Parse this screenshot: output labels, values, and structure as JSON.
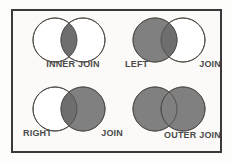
{
  "diagram": {
    "frame_color": "#3a3a3a",
    "background_color": "#fbfaf8",
    "fill_color": "#808080",
    "overlap_color": "#6e6e6e",
    "outline_color": "#55504c",
    "empty_color": "#ffffff",
    "label_color": "#4a4a4a",
    "panels": [
      {
        "id": "inner-join",
        "name": "INNER JOIN",
        "labels": [
          "INNER JOIN"
        ],
        "label_layout": "center",
        "left_circle_filled": false,
        "right_circle_filled": false,
        "intersection_filled": true
      },
      {
        "id": "left-join",
        "name": "LEFT JOIN",
        "labels": [
          "LEFT",
          "JOIN"
        ],
        "label_layout": "spread",
        "left_circle_filled": true,
        "right_circle_filled": false,
        "intersection_filled": true
      },
      {
        "id": "right-join",
        "name": "RIGHT JOIN",
        "labels": [
          "RIGHT",
          "JOIN"
        ],
        "label_layout": "spread",
        "left_circle_filled": false,
        "right_circle_filled": true,
        "intersection_filled": true
      },
      {
        "id": "outer-join",
        "name": "OUTER JOIN",
        "labels": [
          "OUTER JOIN"
        ],
        "label_layout": "right-end",
        "left_circle_filled": true,
        "right_circle_filled": true,
        "intersection_filled": true
      }
    ]
  }
}
